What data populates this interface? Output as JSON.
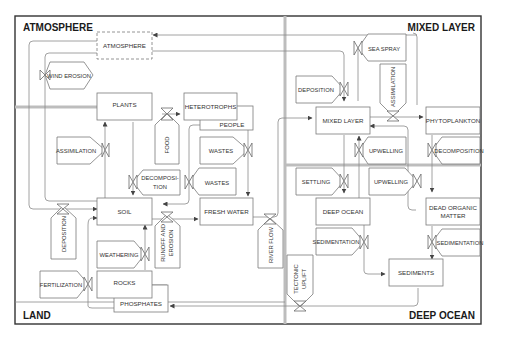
{
  "regions": {
    "atmosphere": "ATMOSPHERE",
    "mixed_layer": "MIXED LAYER",
    "land": "LAND",
    "deep_ocean": "DEEP OCEAN"
  },
  "stocks": {
    "atmosphere": "ATMOSPHERE",
    "plants": "PLANTS",
    "heterotrophs": "HETEROTROPHS",
    "people": "PEOPLE",
    "soil": "SOIL",
    "fresh_water": "FRESH WATER",
    "rocks": "ROCKS",
    "phosphates": "PHOSPHATES",
    "mixed_layer": "MIXED LAYER",
    "phytoplankton": "PHYTOPLANKTON",
    "deep_ocean": "DEEP OCEAN",
    "dead_organic_matter_1": "DEAD ORGANIC",
    "dead_organic_matter_2": "MATTER",
    "sediments": "SEDIMENTS"
  },
  "flows": {
    "wind_erosion": "WIND EROSION",
    "assimilation_land": "ASSIMILATION",
    "food": "FOOD",
    "wastes_1": "WASTES",
    "wastes_2": "WASTES",
    "decomposition_land_1": "DECOMPOSI-",
    "decomposition_land_2": "TION",
    "deposition_land": "DEPOSITION",
    "weathering": "WEATHERING",
    "runoff_1": "RUNOFF AND",
    "runoff_2": "EROSION",
    "fertilization": "FERTILIZATION",
    "river_flow": "RIVER FLOW",
    "tectonic_1": "TECTONIC",
    "tectonic_2": "UPLIFT",
    "sea_spray": "SEA SPRAY",
    "deposition_ocean": "DEPOSITION",
    "assimilation_ocean": "ASSIMILATION",
    "upwelling_1": "UPWELLING",
    "upwelling_2": "UPWELLING",
    "decomposition_ocean": "DECOMPOSITION",
    "settling": "SETTLING",
    "sedimentation_1": "SEDIMENTATION",
    "sedimentation_2": "SEDIMENTATION"
  },
  "colors": {
    "frame": "#333333",
    "divider": "#bdbdbd",
    "box_stroke": "#7a7a7a",
    "text": "#333333"
  }
}
